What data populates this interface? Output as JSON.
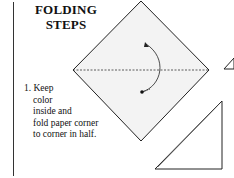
{
  "title": {
    "line1": "FOLDING",
    "line2": "STEPS"
  },
  "step": {
    "number": "1.",
    "lines": [
      "Keep",
      "color",
      "inside and",
      "fold paper corner",
      "to corner in half."
    ]
  },
  "colors": {
    "paper_fill": "#f3f3f3",
    "stroke": "#222222"
  }
}
